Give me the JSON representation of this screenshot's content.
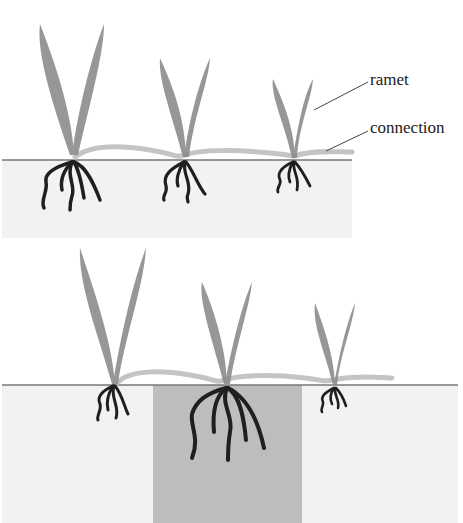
{
  "diagram": {
    "labels": {
      "ramet": "ramet",
      "connection": "connection"
    },
    "panels": [
      {
        "name": "homogeneous-soil",
        "ramets": 3
      },
      {
        "name": "heterogeneous-soil",
        "ramets": 3,
        "rich_patch": "center"
      }
    ],
    "colors": {
      "leaf": "#8c8c8c",
      "connection": "#c4c4c4",
      "root": "#1f1f1f",
      "soil": "#f2f2f2",
      "rich_patch": "#bdbdbd",
      "ground_line": "#777777"
    }
  }
}
